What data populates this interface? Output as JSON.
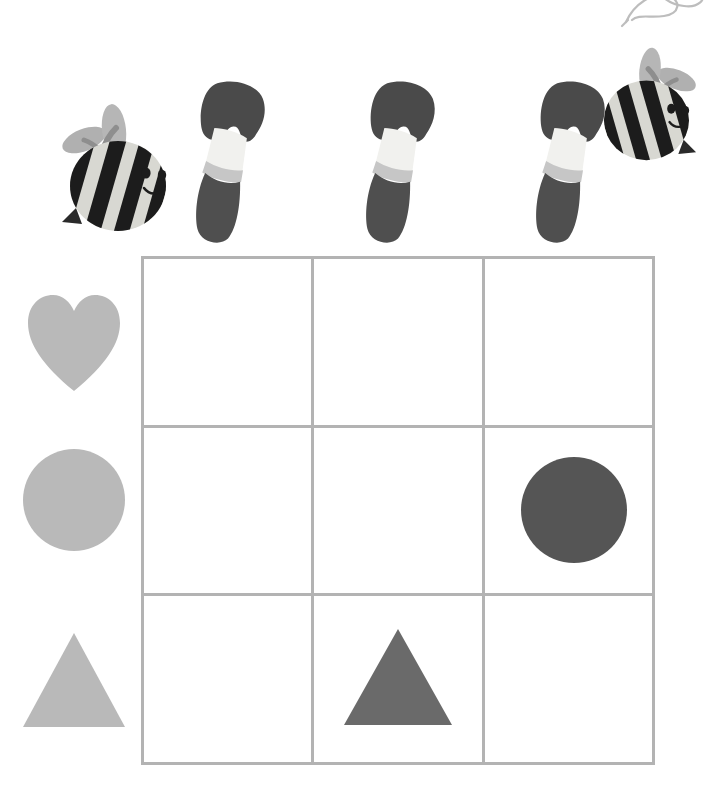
{
  "page": {
    "background_color": "#ffffff",
    "width": 711,
    "height": 805
  },
  "palette": {
    "grid_line": "#b3b3b3",
    "shape_light_gray": "#b9b9b9",
    "shape_mid_gray": "#6a6a6a",
    "shape_dark_gray": "#555555",
    "brush_bristle": "#4a4a4a",
    "brush_ferrule_light": "#f1f1ee",
    "brush_ferrule_band": "#c6c6c6",
    "brush_handle": "#4f4f4f",
    "bee_body_light": "#d8d8d2",
    "bee_stripe": "#1c1c1c",
    "bee_wing": "#b0b0b0",
    "bee_face": "#1c1c1c",
    "corner_wisp": "#bdbdbd"
  },
  "grid": {
    "name": "painting-grid",
    "rows": 3,
    "columns": 3,
    "line_color": "#b3b3b3",
    "cells": [
      {
        "row": 1,
        "column": 1,
        "content": "empty",
        "label": ""
      },
      {
        "row": 1,
        "column": 2,
        "content": "empty",
        "label": ""
      },
      {
        "row": 1,
        "column": 3,
        "content": "empty",
        "label": ""
      },
      {
        "row": 2,
        "column": 1,
        "content": "empty",
        "label": ""
      },
      {
        "row": 2,
        "column": 2,
        "content": "empty",
        "label": ""
      },
      {
        "row": 2,
        "column": 3,
        "content": "circle",
        "label": "dark gray circle",
        "color": "#555555"
      },
      {
        "row": 3,
        "column": 1,
        "content": "empty",
        "label": ""
      },
      {
        "row": 3,
        "column": 2,
        "content": "triangle",
        "label": "gray triangle",
        "color": "#6a6a6a"
      },
      {
        "row": 3,
        "column": 3,
        "content": "empty",
        "label": ""
      }
    ]
  },
  "row_key": {
    "name": "row-shape-key",
    "items": [
      {
        "row": 1,
        "shape": "heart",
        "label": "heart",
        "color": "#b9b9b9"
      },
      {
        "row": 2,
        "shape": "circle",
        "label": "circle",
        "color": "#b9b9b9"
      },
      {
        "row": 3,
        "shape": "triangle",
        "label": "triangle",
        "color": "#b9b9b9"
      }
    ]
  },
  "decorations": {
    "name": "top-decoration-row",
    "items": [
      {
        "kind": "bee",
        "label": "bee facing right",
        "facing": "right",
        "index": 1
      },
      {
        "kind": "paintbrush",
        "label": "paintbrush",
        "index": 1
      },
      {
        "kind": "paintbrush",
        "label": "paintbrush",
        "index": 2
      },
      {
        "kind": "paintbrush",
        "label": "paintbrush",
        "index": 3
      },
      {
        "kind": "bee",
        "label": "bee facing left",
        "facing": "left",
        "index": 2
      },
      {
        "kind": "wing-wisp",
        "label": "partial wing at top edge",
        "index": 1
      }
    ]
  }
}
